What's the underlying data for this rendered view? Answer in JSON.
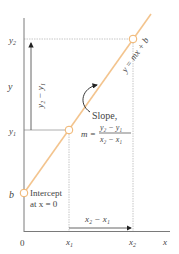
{
  "diagram": {
    "line_equation": "y = mx + b",
    "colors": {
      "line": "#f3c48e",
      "axis": "#7a7a7a",
      "guide": "#b8b8b8",
      "arrow": "#222222",
      "text": "#444444"
    },
    "axes": {
      "x_label": "x",
      "y_label": "y",
      "origin_label": "0"
    },
    "ticks": {
      "x1": "x",
      "x1_sub": "1",
      "x2": "x",
      "x2_sub": "2",
      "y1": "y",
      "y1_sub": "1",
      "y2": "y",
      "y2_sub": "2",
      "b": "b"
    },
    "annotations": {
      "rise": "y₂ − y₁",
      "run": "x₂ − x₁",
      "slope_title": "Slope,",
      "slope_m": "m =",
      "slope_numerator": "y₂ − y₁",
      "slope_denominator": "x₂ − x₁",
      "intercept_line1": "Intercept",
      "intercept_line2": "at x = 0"
    },
    "points": [
      {
        "name": "intercept",
        "x": 24,
        "y": 193
      },
      {
        "name": "point1",
        "x": 69,
        "y": 130
      },
      {
        "name": "point2",
        "x": 133,
        "y": 39
      }
    ]
  }
}
